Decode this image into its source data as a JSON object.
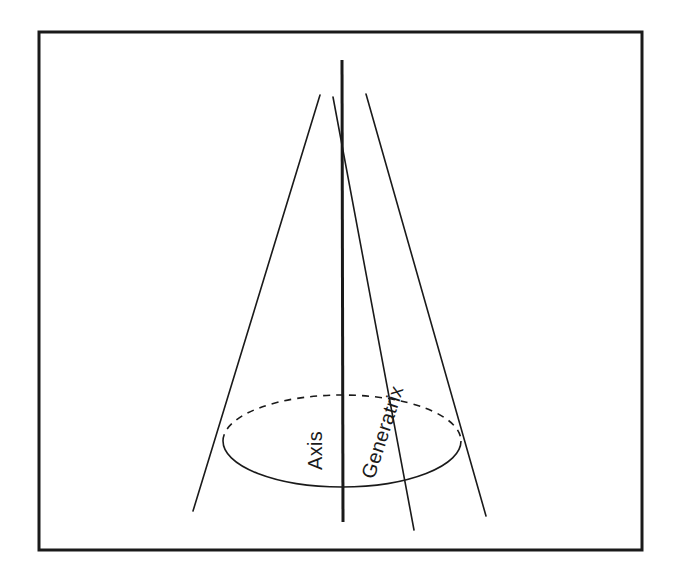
{
  "figure": {
    "type": "geometry-diagram",
    "background_color": "#ffffff",
    "stroke_color": "#1a1a1a",
    "frame": {
      "name": "figure-border",
      "x": 39,
      "y": 32,
      "width": 603,
      "height": 518,
      "stroke_width": 3,
      "fill": "none"
    },
    "labels": [
      {
        "id": "axis",
        "text": "Axis",
        "x": 322,
        "y": 470,
        "rotation": -90,
        "font_size": 20
      },
      {
        "id": "generatrix",
        "text": "Generatrix",
        "x": 374,
        "y": 480,
        "rotation": -72,
        "font_size": 20
      }
    ],
    "geometry": {
      "apex": {
        "x": 343,
        "y": 152
      },
      "base_ellipse": {
        "cx": 342,
        "cy": 441,
        "rx": 119,
        "ry": 46,
        "front_arc_style": "solid",
        "back_arc_style": "dashed",
        "dash_pattern": "7 6"
      },
      "axis_line": {
        "x1": 342,
        "y1": 60,
        "x2": 343,
        "y2": 522,
        "stroke_width": 3
      },
      "rays": [
        {
          "id": "left-generator",
          "x1": 320,
          "y1": 95,
          "x2": 193,
          "y2": 511,
          "stroke_width": 1.6
        },
        {
          "id": "generatrix-ray",
          "x1": 333,
          "y1": 97,
          "x2": 414,
          "y2": 530,
          "stroke_width": 1.6
        },
        {
          "id": "right-generator",
          "x1": 366,
          "y1": 94,
          "x2": 486,
          "y2": 516,
          "stroke_width": 1.6
        }
      ]
    }
  }
}
